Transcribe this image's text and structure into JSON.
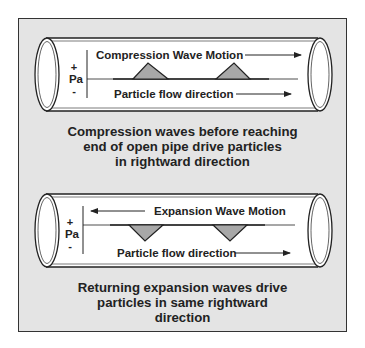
{
  "figure": {
    "colors": {
      "panel_background": "#e4e4e4",
      "wave_fill": "#a8a8a8",
      "pipe_fill": "#ffffff",
      "stroke": "#222222"
    },
    "axis": {
      "plus": "+",
      "label": "Pa",
      "minus": "-"
    },
    "compression": {
      "wave_motion_label": "Compression Wave Motion",
      "wave_motion_direction": "right",
      "flow_label": "Particle flow direction",
      "flow_direction": "right",
      "wave_shape": "peaks",
      "caption_lines": [
        "Compression waves before reaching",
        "end of open pipe drive particles",
        "in rightward direction"
      ]
    },
    "expansion": {
      "wave_motion_label": "Expansion Wave Motion",
      "wave_motion_direction": "left",
      "flow_label": "Particle flow direction",
      "flow_direction": "right",
      "wave_shape": "valleys",
      "caption_lines": [
        "Returning expansion waves drive",
        "particles in same rightward",
        "direction"
      ]
    }
  }
}
